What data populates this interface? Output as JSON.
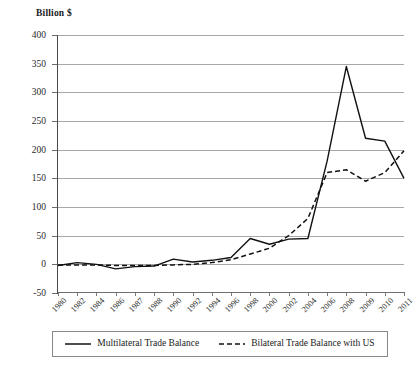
{
  "chart_data": {
    "type": "line",
    "title": "",
    "ylabel": "Billion $",
    "xlabel": "",
    "ylim": [
      -50,
      400
    ],
    "ytick_step": 50,
    "yticks": [
      400,
      350,
      300,
      250,
      200,
      150,
      100,
      50,
      0,
      -50
    ],
    "grid": "horizontal",
    "legend_position": "bottom",
    "categories": [
      "1980",
      "1982",
      "1984",
      "1986",
      "1987",
      "1988",
      "1990",
      "1992",
      "1994",
      "1996",
      "1998",
      "2000",
      "2002",
      "2004",
      "2006",
      "2008",
      "2009",
      "2010",
      "2011"
    ],
    "series": [
      {
        "name": "Multilateral Trade Balance",
        "style": "solid",
        "color": "#111111",
        "values": [
          -2,
          3,
          0,
          -8,
          -4,
          -3,
          9,
          4,
          7,
          12,
          45,
          35,
          44,
          45,
          180,
          345,
          220,
          215,
          150
        ]
      },
      {
        "name": "Bilateral Trade Balance with US",
        "style": "dashed",
        "color": "#111111",
        "values": [
          -1,
          -1,
          -1,
          -2,
          -2,
          -2,
          -1,
          0,
          3,
          8,
          18,
          28,
          50,
          80,
          160,
          165,
          145,
          160,
          198
        ]
      }
    ]
  },
  "legend": {
    "entries": [
      {
        "label": "Multilateral Trade Balance",
        "style": "solid"
      },
      {
        "label": "Bilateral Trade Balance with US",
        "style": "dashed"
      }
    ]
  }
}
